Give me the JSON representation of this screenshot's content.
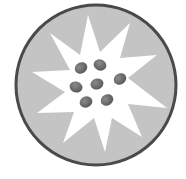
{
  "icon": {
    "name": "starburst-seeds-icon",
    "colors": {
      "background": "#ffffff",
      "circle_fill": "#c4c4c4",
      "circle_stroke": "#4a4a4a",
      "star_fill": "#ffffff",
      "dot_fill": "#6e6e6e"
    },
    "dot_count": 7
  }
}
